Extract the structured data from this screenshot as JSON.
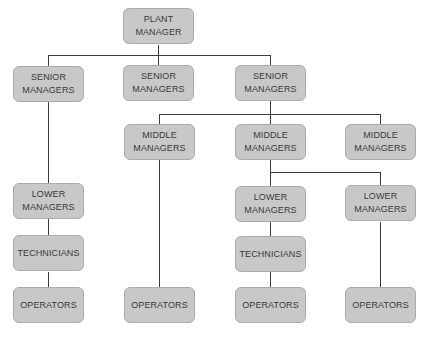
{
  "diagram": {
    "type": "org-chart",
    "colors": {
      "box_fill": "#c8c8c8",
      "box_border": "#ababab",
      "line": "#3c3c3c",
      "text": "#3a3a3a"
    },
    "nodes": {
      "plant_manager": "PLANT\nMANAGER",
      "senior_1": "SENIOR\nMANAGERS",
      "senior_2": "SENIOR\nMANAGERS",
      "senior_3": "SENIOR\nMANAGERS",
      "middle_1": "MIDDLE\nMANAGERS",
      "middle_2": "MIDDLE\nMANAGERS",
      "middle_3": "MIDDLE\nMANAGERS",
      "lower_1": "LOWER\nMANAGERS",
      "lower_2": "LOWER\nMANAGERS",
      "lower_3": "LOWER\nMANAGERS",
      "technicians_1": "TECHNICIANS",
      "technicians_2": "TECHNICIANS",
      "operators_1": "OPERATORS",
      "operators_2": "OPERATORS",
      "operators_3": "OPERATORS",
      "operators_4": "OPERATORS"
    },
    "hierarchy": [
      {
        "id": "plant_manager",
        "children": [
          "senior_1",
          "senior_2",
          "senior_3"
        ]
      },
      {
        "id": "senior_1",
        "children": [
          "lower_1"
        ]
      },
      {
        "id": "lower_1",
        "children": [
          "technicians_1"
        ]
      },
      {
        "id": "technicians_1",
        "children": [
          "operators_1"
        ]
      },
      {
        "id": "senior_2",
        "children": []
      },
      {
        "id": "senior_3",
        "children": [
          "middle_1",
          "middle_2",
          "middle_3"
        ]
      },
      {
        "id": "middle_1",
        "children": [
          "operators_2"
        ]
      },
      {
        "id": "middle_2",
        "children": [
          "lower_2",
          "lower_3"
        ]
      },
      {
        "id": "lower_2",
        "children": [
          "technicians_2"
        ]
      },
      {
        "id": "technicians_2",
        "children": [
          "operators_3"
        ]
      },
      {
        "id": "lower_3",
        "children": [
          "operators_4"
        ]
      },
      {
        "id": "middle_3",
        "children": []
      }
    ]
  }
}
